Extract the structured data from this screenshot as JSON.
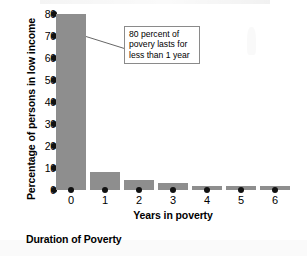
{
  "caption": "Duration of Poverty",
  "annotation": {
    "line1": "80 percent of",
    "line2": "povery lasts for",
    "line3": "less than 1 year"
  },
  "colors": {
    "bar": "#8e8e8e",
    "text": "#000000",
    "annotation_border": "#8a8a8a",
    "background": "#ffffff"
  },
  "chart_data": {
    "type": "bar",
    "title": "Duration of Poverty",
    "xlabel": "Years in poverty",
    "ylabel": "Percentage of persons in low income",
    "categories": [
      "0",
      "1",
      "2",
      "3",
      "4",
      "5",
      "6"
    ],
    "values": [
      80,
      8,
      4.5,
      3,
      2,
      2,
      2
    ],
    "ylim": [
      0,
      80
    ],
    "yticks": [
      0,
      10,
      20,
      30,
      40,
      50,
      60,
      70,
      80
    ],
    "ytick_labels": [
      "0",
      "10",
      "20",
      "30",
      "40",
      "50",
      "60",
      "70",
      "80"
    ],
    "grid": false,
    "legend": false,
    "annotations": [
      {
        "text": "80 percent of povery lasts for less than 1 year",
        "points_to_category": "0"
      }
    ]
  }
}
